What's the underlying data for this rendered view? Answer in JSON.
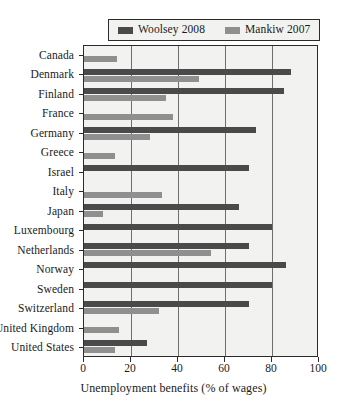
{
  "chart_data": {
    "type": "bar",
    "orientation": "horizontal",
    "title": "",
    "xlabel": "Unemployment benefits (% of wages)",
    "ylabel": "",
    "xlim": [
      0,
      100
    ],
    "xticks": [
      0,
      20,
      40,
      60,
      80,
      100
    ],
    "xtick_labels": [
      "0",
      "20",
      "40",
      "60",
      "80",
      "100"
    ],
    "grid": true,
    "grid_axis": "x",
    "legend_position": "top",
    "categories": [
      "Canada",
      "Denmark",
      "Finland",
      "France",
      "Germany",
      "Greece",
      "Israel",
      "Italy",
      "Japan",
      "Luxembourg",
      "Netherlands",
      "Norway",
      "Sweden",
      "Switzerland",
      "United Kingdom",
      "United States"
    ],
    "series": [
      {
        "name": "Woolsey 2008",
        "color": "#4a4a4a",
        "values": [
          0,
          88,
          85,
          0,
          73,
          0,
          70,
          0,
          66,
          80,
          70,
          86,
          80,
          70,
          0,
          27
        ]
      },
      {
        "name": "Mankiw 2007",
        "color": "#8f8f8f",
        "values": [
          14,
          49,
          35,
          38,
          28,
          13,
          0,
          33,
          8,
          0,
          54,
          0,
          0,
          32,
          15,
          13
        ]
      }
    ]
  },
  "legend": {
    "entries": [
      {
        "label": "Woolsey 2008",
        "color": "#4a4a4a"
      },
      {
        "label": "Mankiw 2007",
        "color": "#8f8f8f"
      }
    ]
  }
}
